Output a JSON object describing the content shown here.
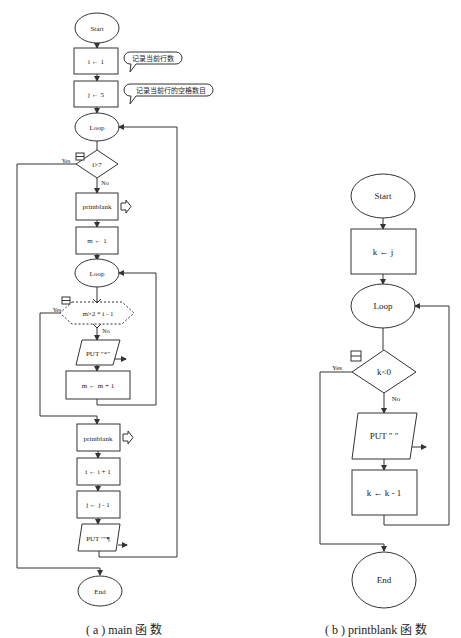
{
  "diagram_a": {
    "start": "Start",
    "init_i": "i ← 1",
    "comment_i": "记录当前行数",
    "init_j": "j ← 5",
    "comment_j": "记录当前行的空格数目",
    "loop_outer": "Loop",
    "cond_outer": "i>7",
    "cond_outer_yes": "Yes",
    "cond_outer_no": "No",
    "call_printblank_1": "printblank",
    "init_m": "m ← 1",
    "loop_inner": "Loop",
    "cond_inner": "m>2 * i - 1",
    "cond_inner_yes": "Yes",
    "cond_inner_no": "No",
    "put_star": "PUT \"*\"",
    "inc_m": "m ← m + 1",
    "call_printblank_2": "printblank",
    "inc_i": "i ← i + 1",
    "dec_j": "j ← j - 1",
    "put_newline": "PUT \"\"¶",
    "end": "End",
    "caption": "( a ) main 函 数"
  },
  "diagram_b": {
    "start": "Start",
    "init_k": "k ← j",
    "loop": "Loop",
    "cond": "k<0",
    "cond_yes": "Yes",
    "cond_no": "No",
    "put_space": "PUT \" \"",
    "dec_k": "k ← k - 1",
    "end": "End",
    "caption": "( b ) printblank 函 数"
  },
  "colors": {
    "stroke": "#333333",
    "text": "#222222",
    "background": "#ffffff"
  }
}
